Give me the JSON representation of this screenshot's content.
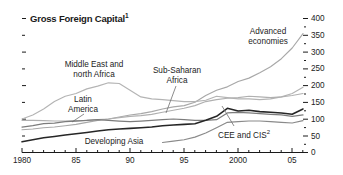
{
  "chart_data": {
    "type": "line",
    "title": "Gross Foreign Capital",
    "title_superscript": "1",
    "xlabel": "",
    "ylabel": "",
    "xlim": [
      1980,
      2006
    ],
    "ylim": [
      0,
      400
    ],
    "grid": false,
    "y_axis_position": "right",
    "y_ticks": [
      0,
      50,
      100,
      150,
      200,
      250,
      300,
      350,
      400
    ],
    "y_tick_labels": [
      "0",
      "50",
      "100",
      "150",
      "200",
      "250",
      "300",
      "350",
      "400"
    ],
    "x_ticks": [
      1980,
      1985,
      1990,
      1995,
      2000,
      2005
    ],
    "x_tick_labels": [
      "1980",
      "85",
      "90",
      "95",
      "2000",
      "05"
    ],
    "x": [
      1980,
      1981,
      1982,
      1983,
      1984,
      1985,
      1986,
      1987,
      1988,
      1989,
      1990,
      1991,
      1992,
      1993,
      1994,
      1995,
      1996,
      1997,
      1998,
      1999,
      2000,
      2001,
      2002,
      2003,
      2004,
      2005,
      2006
    ],
    "legend_position": "inline-annotations",
    "series": [
      {
        "name": "Advanced economies",
        "color": "#a8a8a8",
        "label_x": 268,
        "label_y": 34,
        "values": [
          68,
          70,
          74,
          76,
          80,
          84,
          90,
          96,
          100,
          106,
          112,
          116,
          122,
          130,
          136,
          140,
          150,
          170,
          186,
          196,
          212,
          222,
          238,
          256,
          280,
          312,
          355
        ]
      },
      {
        "name": "Middle East and north Africa",
        "color": "#b4b4b4",
        "label_x": 94,
        "label_y": 68,
        "values": [
          100,
          112,
          130,
          152,
          168,
          176,
          190,
          198,
          208,
          206,
          186,
          166,
          160,
          158,
          155,
          152,
          152,
          156,
          168,
          164,
          160,
          160,
          158,
          160,
          166,
          176,
          195
        ]
      },
      {
        "name": "Sub-Saharan Africa",
        "color": "#b0b0b0",
        "label_x": 176,
        "label_y": 74,
        "values": [
          96,
          96,
          95,
          94,
          94,
          95,
          96,
          98,
          100,
          104,
          108,
          110,
          114,
          120,
          126,
          132,
          140,
          152,
          158,
          162,
          164,
          168,
          166,
          164,
          166,
          170,
          176
        ]
      },
      {
        "name": "Latin America",
        "color": "#7c7c7c",
        "label_x": 74,
        "label_y": 103,
        "values": [
          76,
          80,
          86,
          88,
          92,
          94,
          96,
          98,
          96,
          94,
          92,
          94,
          96,
          98,
          100,
          98,
          96,
          96,
          98,
          118,
          120,
          118,
          116,
          114,
          112,
          108,
          112
        ]
      },
      {
        "name": "CEE and CIS",
        "color": "#8a8a8a",
        "label_superscript": "2",
        "label_x": 240,
        "label_y": 132,
        "start_year": 1993,
        "values": [
          null,
          null,
          null,
          null,
          null,
          null,
          null,
          null,
          null,
          null,
          null,
          null,
          null,
          30,
          34,
          38,
          46,
          58,
          74,
          90,
          92,
          94,
          94,
          92,
          90,
          88,
          95
        ]
      },
      {
        "name": "Developing Asia",
        "color": "#262626",
        "label_x": 112,
        "label_y": 141,
        "values": [
          32,
          38,
          44,
          48,
          52,
          56,
          60,
          64,
          68,
          70,
          72,
          74,
          76,
          80,
          82,
          84,
          86,
          96,
          108,
          132,
          124,
          126,
          122,
          120,
          118,
          114,
          130
        ]
      }
    ],
    "annotations": [
      {
        "text": "Advanced economies",
        "leader": false
      },
      {
        "text": "Middle East and north Africa",
        "leader": false
      },
      {
        "text": "Sub-Saharan Africa",
        "leader": true
      },
      {
        "text": "Latin America",
        "leader": true
      },
      {
        "text": "CEE and CIS",
        "leader": true
      },
      {
        "text": "Developing Asia",
        "leader": false
      }
    ]
  },
  "labels": {
    "title": "Gross Foreign Capital",
    "title_sup": "1",
    "advanced_line1": "Advanced",
    "advanced_line2": "economies",
    "mena_line1": "Middle East and",
    "mena_line2": "north Africa",
    "ssa_line1": "Sub-Saharan",
    "ssa_line2": "Africa",
    "latam_line1": "Latin",
    "latam_line2": "America",
    "cee": "CEE and CIS",
    "cee_sup": "2",
    "asia": "Developing Asia",
    "y0": "0",
    "y50": "50",
    "y100": "100",
    "y150": "150",
    "y200": "200",
    "y250": "250",
    "y300": "300",
    "y350": "350",
    "y400": "400",
    "x1980": "1980",
    "x85": "85",
    "x90": "90",
    "x95": "95",
    "x2000": "2000",
    "x05": "05"
  },
  "colors": {
    "axis": "#1a1a1a",
    "text": "#232323",
    "bg": "#ffffff"
  }
}
